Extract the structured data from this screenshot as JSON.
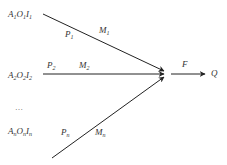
{
  "diagram": {
    "colors": {
      "line": "#222222",
      "text": "#333333",
      "background": "#ffffff"
    },
    "inputs": [
      {
        "base": [
          "A",
          "O",
          "I"
        ],
        "sub": "1",
        "p_label": "P",
        "p_sub": "1",
        "m_label": "M",
        "m_sub": "1"
      },
      {
        "base": [
          "A",
          "O",
          "I"
        ],
        "sub": "2",
        "p_label": "P",
        "p_sub": "2",
        "m_label": "M",
        "m_sub": "2"
      },
      {
        "base": [
          "A",
          "O",
          "I"
        ],
        "sub": "n",
        "p_label": "P",
        "p_sub": "n",
        "m_label": "M",
        "m_sub": "n"
      }
    ],
    "ellipsis": "…",
    "function_label": "F",
    "output_label": "Q"
  }
}
